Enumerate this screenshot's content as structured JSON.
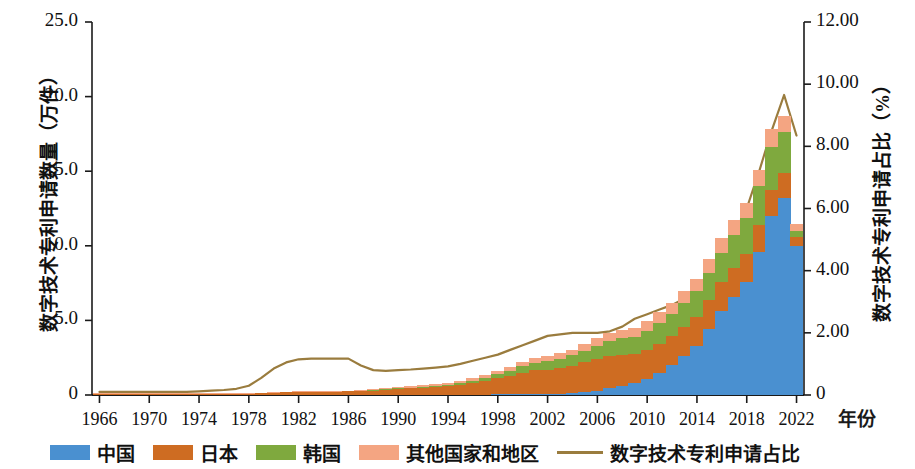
{
  "axes": {
    "y_left_title": "数字技术专利申请数量（万件）",
    "y_right_title": "数字技术专利申请占比（%）",
    "x_unit": "年份",
    "y_left_ticks": [
      "0",
      "5.0",
      "10.0",
      "15.0",
      "20.0",
      "25.0"
    ],
    "y_right_ticks": [
      "0",
      "2.00",
      "4.00",
      "6.00",
      "8.00",
      "10.00",
      "12.00"
    ],
    "x_ticks": [
      "1966",
      "1970",
      "1974",
      "1978",
      "1982",
      "1986",
      "1990",
      "1994",
      "1998",
      "2002",
      "2006",
      "2010",
      "2014",
      "2018",
      "2022"
    ]
  },
  "legend": {
    "items": [
      {
        "label": "中国",
        "color": "#4A90D0",
        "type": "swatch"
      },
      {
        "label": "日本",
        "color": "#CE6C22",
        "type": "swatch"
      },
      {
        "label": "韩国",
        "color": "#7FA93E",
        "type": "swatch"
      },
      {
        "label": "其他国家和地区",
        "color": "#F4A582",
        "type": "swatch"
      },
      {
        "label": "数字技术专利申请占比",
        "color": "#9A7C3E",
        "type": "line"
      }
    ]
  },
  "colors": {
    "china": "#4A90D0",
    "japan": "#CE6C22",
    "korea": "#7FA93E",
    "others": "#F4A582",
    "share_line": "#9A7C3E",
    "axis": "#1a1a1a"
  },
  "chart_data": {
    "type": "bar",
    "title": "",
    "subtitle": "",
    "xlabel": "年份",
    "ylabel": "数字技术专利申请数量（万件）",
    "ylabel_secondary": "数字技术专利申请占比（%）",
    "ylim": [
      0,
      25
    ],
    "ylim_secondary": [
      0,
      12
    ],
    "grid": false,
    "legend_position": "bottom",
    "stacked": true,
    "x": [
      1966,
      1967,
      1968,
      1969,
      1970,
      1971,
      1972,
      1973,
      1974,
      1975,
      1976,
      1977,
      1978,
      1979,
      1980,
      1981,
      1982,
      1983,
      1984,
      1985,
      1986,
      1987,
      1988,
      1989,
      1990,
      1991,
      1992,
      1993,
      1994,
      1995,
      1996,
      1997,
      1998,
      1999,
      2000,
      2001,
      2002,
      2003,
      2004,
      2005,
      2006,
      2007,
      2008,
      2009,
      2010,
      2011,
      2012,
      2013,
      2014,
      2015,
      2016,
      2017,
      2018,
      2019,
      2020,
      2021,
      2022
    ],
    "categories": [
      "1966",
      "1967",
      "1968",
      "1969",
      "1970",
      "1971",
      "1972",
      "1973",
      "1974",
      "1975",
      "1976",
      "1977",
      "1978",
      "1979",
      "1980",
      "1981",
      "1982",
      "1983",
      "1984",
      "1985",
      "1986",
      "1987",
      "1988",
      "1989",
      "1990",
      "1991",
      "1992",
      "1993",
      "1994",
      "1995",
      "1996",
      "1997",
      "1998",
      "1999",
      "2000",
      "2001",
      "2002",
      "2003",
      "2004",
      "2005",
      "2006",
      "2007",
      "2008",
      "2009",
      "2010",
      "2011",
      "2012",
      "2013",
      "2014",
      "2015",
      "2016",
      "2017",
      "2018",
      "2019",
      "2020",
      "2021",
      "2022"
    ],
    "series": [
      {
        "name": "中国",
        "color": "#4A90D0",
        "axis": "left",
        "values": [
          0,
          0,
          0,
          0,
          0,
          0,
          0,
          0,
          0,
          0,
          0,
          0,
          0,
          0,
          0,
          0,
          0,
          0,
          0,
          0,
          0,
          0,
          0,
          0,
          0,
          0,
          0,
          0,
          0,
          0,
          0,
          0,
          0.02,
          0.03,
          0.04,
          0.05,
          0.06,
          0.08,
          0.12,
          0.2,
          0.3,
          0.45,
          0.6,
          0.8,
          1.1,
          1.5,
          2.0,
          2.6,
          3.3,
          4.4,
          5.6,
          6.6,
          7.6,
          9.6,
          12.0,
          13.2,
          10.0
        ]
      },
      {
        "name": "日本",
        "color": "#CE6C22",
        "axis": "left",
        "values": [
          0.04,
          0.04,
          0.05,
          0.05,
          0.05,
          0.05,
          0.05,
          0.05,
          0.05,
          0.05,
          0.06,
          0.07,
          0.09,
          0.11,
          0.14,
          0.17,
          0.2,
          0.21,
          0.22,
          0.23,
          0.24,
          0.26,
          0.3,
          0.35,
          0.4,
          0.45,
          0.5,
          0.55,
          0.62,
          0.7,
          0.82,
          0.95,
          1.1,
          1.25,
          1.45,
          1.6,
          1.65,
          1.75,
          1.85,
          2.0,
          2.1,
          2.15,
          2.1,
          1.95,
          1.95,
          1.95,
          1.95,
          1.95,
          1.95,
          1.95,
          1.95,
          1.9,
          1.85,
          1.8,
          1.75,
          1.7,
          0.6
        ]
      },
      {
        "name": "韩国",
        "color": "#7FA93E",
        "axis": "left",
        "values": [
          0,
          0,
          0,
          0,
          0,
          0,
          0,
          0,
          0,
          0,
          0,
          0,
          0,
          0,
          0,
          0,
          0,
          0,
          0,
          0,
          0,
          0,
          0.01,
          0.01,
          0.02,
          0.03,
          0.04,
          0.05,
          0.07,
          0.1,
          0.14,
          0.18,
          0.25,
          0.32,
          0.42,
          0.5,
          0.55,
          0.6,
          0.68,
          0.78,
          0.9,
          1.0,
          1.1,
          1.15,
          1.25,
          1.4,
          1.5,
          1.6,
          1.7,
          1.85,
          2.0,
          2.2,
          2.4,
          2.6,
          2.9,
          2.7,
          0.4
        ]
      },
      {
        "name": "其他国家和地区",
        "color": "#F4A582",
        "axis": "left",
        "values": [
          0.02,
          0.02,
          0.02,
          0.02,
          0.02,
          0.02,
          0.02,
          0.02,
          0.02,
          0.02,
          0.02,
          0.02,
          0.03,
          0.03,
          0.04,
          0.04,
          0.05,
          0.05,
          0.05,
          0.05,
          0.05,
          0.06,
          0.07,
          0.08,
          0.09,
          0.1,
          0.11,
          0.12,
          0.14,
          0.16,
          0.18,
          0.2,
          0.24,
          0.27,
          0.32,
          0.35,
          0.36,
          0.38,
          0.4,
          0.44,
          0.5,
          0.55,
          0.58,
          0.6,
          0.65,
          0.7,
          0.75,
          0.8,
          0.85,
          0.9,
          0.95,
          1.0,
          1.05,
          1.1,
          1.15,
          1.1,
          0.45
        ]
      }
    ],
    "line_series": {
      "name": "数字技术专利申请占比",
      "color": "#9A7C3E",
      "axis": "right",
      "unit": "%",
      "values": [
        0.1,
        0.1,
        0.1,
        0.1,
        0.1,
        0.1,
        0.1,
        0.1,
        0.12,
        0.14,
        0.16,
        0.2,
        0.3,
        0.55,
        0.85,
        1.05,
        1.15,
        1.17,
        1.17,
        1.17,
        1.17,
        0.95,
        0.8,
        0.78,
        0.8,
        0.82,
        0.85,
        0.88,
        0.92,
        1.0,
        1.1,
        1.2,
        1.3,
        1.45,
        1.6,
        1.75,
        1.9,
        1.95,
        2.0,
        2.0,
        2.0,
        2.05,
        2.2,
        2.45,
        2.6,
        2.75,
        2.9,
        3.1,
        3.45,
        3.7,
        4.5,
        5.2,
        6.0,
        7.2,
        8.5,
        9.65,
        8.35
      ]
    }
  }
}
